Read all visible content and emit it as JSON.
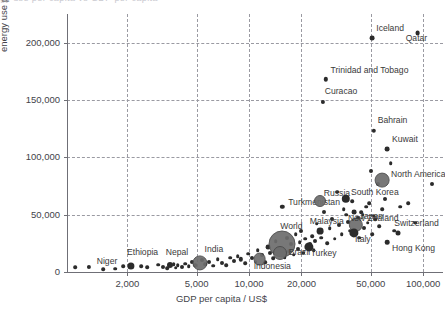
{
  "title_remnant": "gy use per capita vs GDP per capita",
  "chart_data": {
    "type": "scatter",
    "title": "",
    "xlabel": "GDP per capita / US$",
    "ylabel": "energy use per capita / kWh",
    "xscale": "log",
    "yscale": "linear",
    "xlim": [
      900,
      130000
    ],
    "ylim": [
      0,
      225000
    ],
    "grid": true,
    "legend": "none",
    "xticks": [
      "2,000",
      "5,000",
      "10,000",
      "20,000",
      "50,000",
      "100,000"
    ],
    "xtick_values": [
      2000,
      5000,
      10000,
      20000,
      50000,
      100000
    ],
    "yticks": [
      "0",
      "50,000",
      "100,000",
      "150,000",
      "200,000"
    ],
    "ytick_values": [
      0,
      50000,
      100000,
      150000,
      200000
    ],
    "size_encoding": "population",
    "labeled_points": [
      {
        "name": "Niger",
        "x": 1200,
        "y": 4500,
        "r": 2.1,
        "lx": 8,
        "ly": -4
      },
      {
        "name": "Ethiopia",
        "x": 2100,
        "y": 5200,
        "r": 3.6,
        "lx": -4,
        "ly": -12
      },
      {
        "name": "Nepal",
        "x": 3500,
        "y": 6500,
        "r": 3.0,
        "lx": -4,
        "ly": -11
      },
      {
        "name": "India",
        "x": 5200,
        "y": 8200,
        "r": 6.6,
        "lx": 5,
        "ly": -12
      },
      {
        "name": "Indonesia",
        "x": 11500,
        "y": 11500,
        "r": 5.4,
        "lx": -6,
        "ly": 9
      },
      {
        "name": "World",
        "x": 15500,
        "y": 24500,
        "r": 12.5,
        "lx": -2,
        "ly": -16
      },
      {
        "name": "Brazil",
        "x": 15000,
        "y": 17000,
        "r": 6.0,
        "lx": 9,
        "ly": 1
      },
      {
        "name": "Turkey",
        "x": 22000,
        "y": 22000,
        "r": 4.6,
        "lx": 2,
        "ly": 8
      },
      {
        "name": "Turkmenistan",
        "x": 15500,
        "y": 57000,
        "r": 2.2,
        "lx": 6,
        "ly": -3
      },
      {
        "name": "Malaysia",
        "x": 25500,
        "y": 36000,
        "r": 3.4,
        "lx": -10,
        "ly": -8
      },
      {
        "name": "Russia",
        "x": 25500,
        "y": 62000,
        "r": 5.0,
        "lx": 4,
        "ly": -6
      },
      {
        "name": "South Korea",
        "x": 36000,
        "y": 64000,
        "r": 4.2,
        "lx": 5,
        "ly": -5
      },
      {
        "name": "Japan",
        "x": 41000,
        "y": 41000,
        "r": 6.2,
        "lx": 4,
        "ly": -7
      },
      {
        "name": "Italy",
        "x": 40000,
        "y": 34000,
        "r": 4.6,
        "lx": 1,
        "ly": 8
      },
      {
        "name": "New Zealand",
        "x": 40000,
        "y": 52000,
        "r": 2.4,
        "lx": -6,
        "ly": 8
      },
      {
        "name": "North America",
        "x": 58000,
        "y": 80000,
        "r": 6.4,
        "lx": 9,
        "ly": -4
      },
      {
        "name": "Hong Kong",
        "x": 62000,
        "y": 26000,
        "r": 2.3,
        "lx": 5,
        "ly": 8
      },
      {
        "name": "Switzerland",
        "x": 72000,
        "y": 34000,
        "r": 2.5,
        "lx": -4,
        "ly": -8
      },
      {
        "name": "Kuwait",
        "x": 62000,
        "y": 107000,
        "r": 2.4,
        "lx": 5,
        "ly": -8
      },
      {
        "name": "Bahrain",
        "x": 52000,
        "y": 123000,
        "r": 2.2,
        "lx": 4,
        "ly": -9
      },
      {
        "name": "Curacao",
        "x": 26500,
        "y": 148000,
        "r": 2.1,
        "lx": 2,
        "ly": -9
      },
      {
        "name": "Trinidad and Tobago",
        "x": 27500,
        "y": 168000,
        "r": 2.2,
        "lx": 5,
        "ly": -7
      },
      {
        "name": "Iceland",
        "x": 51000,
        "y": 204000,
        "r": 2.4,
        "lx": 4,
        "ly": -8
      },
      {
        "name": "Qatar",
        "x": 93000,
        "y": 208000,
        "r": 2.4,
        "lx": -12,
        "ly": 7
      }
    ],
    "unlabeled_points": [
      {
        "x": 1000,
        "y": 4200,
        "r": 1.8
      },
      {
        "x": 1450,
        "y": 2400,
        "r": 1.8
      },
      {
        "x": 1700,
        "y": 3000,
        "r": 1.8
      },
      {
        "x": 1900,
        "y": 4800,
        "r": 1.8
      },
      {
        "x": 2400,
        "y": 5000,
        "r": 1.8
      },
      {
        "x": 2600,
        "y": 4000,
        "r": 1.8
      },
      {
        "x": 3000,
        "y": 6200,
        "r": 1.8
      },
      {
        "x": 3200,
        "y": 4500,
        "r": 2.0
      },
      {
        "x": 3400,
        "y": 3200,
        "r": 1.8
      },
      {
        "x": 3700,
        "y": 7000,
        "r": 1.8
      },
      {
        "x": 3800,
        "y": 3600,
        "r": 1.8
      },
      {
        "x": 3900,
        "y": 5800,
        "r": 1.8
      },
      {
        "x": 4100,
        "y": 4200,
        "r": 2.0
      },
      {
        "x": 4300,
        "y": 7200,
        "r": 1.8
      },
      {
        "x": 4500,
        "y": 5200,
        "r": 1.8
      },
      {
        "x": 4700,
        "y": 9000,
        "r": 2.0
      },
      {
        "x": 4900,
        "y": 6000,
        "r": 1.8
      },
      {
        "x": 5400,
        "y": 10500,
        "r": 2.0
      },
      {
        "x": 5600,
        "y": 7000,
        "r": 1.8
      },
      {
        "x": 5900,
        "y": 8800,
        "r": 2.0
      },
      {
        "x": 6200,
        "y": 5600,
        "r": 1.8
      },
      {
        "x": 6600,
        "y": 11000,
        "r": 1.8
      },
      {
        "x": 7000,
        "y": 7500,
        "r": 2.0
      },
      {
        "x": 7400,
        "y": 6000,
        "r": 1.8
      },
      {
        "x": 7800,
        "y": 12500,
        "r": 1.8
      },
      {
        "x": 8200,
        "y": 9500,
        "r": 2.0
      },
      {
        "x": 8600,
        "y": 14000,
        "r": 1.8
      },
      {
        "x": 9000,
        "y": 11000,
        "r": 2.2
      },
      {
        "x": 9500,
        "y": 7800,
        "r": 1.8
      },
      {
        "x": 9900,
        "y": 16000,
        "r": 1.8
      },
      {
        "x": 10400,
        "y": 12000,
        "r": 2.0
      },
      {
        "x": 10900,
        "y": 9000,
        "r": 1.8
      },
      {
        "x": 11200,
        "y": 19000,
        "r": 1.8
      },
      {
        "x": 11800,
        "y": 14500,
        "r": 2.0
      },
      {
        "x": 12400,
        "y": 8500,
        "r": 1.8
      },
      {
        "x": 12800,
        "y": 22000,
        "r": 2.4
      },
      {
        "x": 13200,
        "y": 16500,
        "r": 2.0
      },
      {
        "x": 13800,
        "y": 12000,
        "r": 1.8
      },
      {
        "x": 14200,
        "y": 27000,
        "r": 1.8
      },
      {
        "x": 14800,
        "y": 20000,
        "r": 2.0
      },
      {
        "x": 16000,
        "y": 13000,
        "r": 1.8
      },
      {
        "x": 16500,
        "y": 30000,
        "r": 2.0
      },
      {
        "x": 17000,
        "y": 18000,
        "r": 1.8
      },
      {
        "x": 17500,
        "y": 24000,
        "r": 2.0
      },
      {
        "x": 18000,
        "y": 15000,
        "r": 1.8
      },
      {
        "x": 18500,
        "y": 33000,
        "r": 1.8
      },
      {
        "x": 19000,
        "y": 20000,
        "r": 2.0
      },
      {
        "x": 19500,
        "y": 26000,
        "r": 1.8
      },
      {
        "x": 20000,
        "y": 36000,
        "r": 2.0
      },
      {
        "x": 20500,
        "y": 17000,
        "r": 1.8
      },
      {
        "x": 21000,
        "y": 29000,
        "r": 1.8
      },
      {
        "x": 22500,
        "y": 24000,
        "r": 2.0
      },
      {
        "x": 23000,
        "y": 31000,
        "r": 1.8
      },
      {
        "x": 23500,
        "y": 19000,
        "r": 1.8
      },
      {
        "x": 24000,
        "y": 27000,
        "r": 2.0
      },
      {
        "x": 24500,
        "y": 42000,
        "r": 1.8
      },
      {
        "x": 26000,
        "y": 30000,
        "r": 1.8
      },
      {
        "x": 27000,
        "y": 52000,
        "r": 2.0
      },
      {
        "x": 28000,
        "y": 25000,
        "r": 1.8
      },
      {
        "x": 29000,
        "y": 38000,
        "r": 1.8
      },
      {
        "x": 30000,
        "y": 46000,
        "r": 2.0
      },
      {
        "x": 31000,
        "y": 29000,
        "r": 1.8
      },
      {
        "x": 32000,
        "y": 70000,
        "r": 1.8
      },
      {
        "x": 33000,
        "y": 41000,
        "r": 2.0
      },
      {
        "x": 34000,
        "y": 33000,
        "r": 1.8
      },
      {
        "x": 35000,
        "y": 55000,
        "r": 1.8
      },
      {
        "x": 37000,
        "y": 44000,
        "r": 2.0
      },
      {
        "x": 38000,
        "y": 36000,
        "r": 1.8
      },
      {
        "x": 39000,
        "y": 62000,
        "r": 1.8
      },
      {
        "x": 42000,
        "y": 47000,
        "r": 2.0
      },
      {
        "x": 43000,
        "y": 30000,
        "r": 1.8
      },
      {
        "x": 45000,
        "y": 50000,
        "r": 1.8
      },
      {
        "x": 46000,
        "y": 38000,
        "r": 2.0
      },
      {
        "x": 47000,
        "y": 57000,
        "r": 1.8
      },
      {
        "x": 48000,
        "y": 43000,
        "r": 1.8
      },
      {
        "x": 50000,
        "y": 88000,
        "r": 2.0
      },
      {
        "x": 51000,
        "y": 33000,
        "r": 1.8
      },
      {
        "x": 53000,
        "y": 46000,
        "r": 1.8
      },
      {
        "x": 55000,
        "y": 77000,
        "r": 2.0
      },
      {
        "x": 56000,
        "y": 40000,
        "r": 1.8
      },
      {
        "x": 58000,
        "y": 55000,
        "r": 1.8
      },
      {
        "x": 60000,
        "y": 64000,
        "r": 2.0
      },
      {
        "x": 65000,
        "y": 95000,
        "r": 1.8
      },
      {
        "x": 68000,
        "y": 36000,
        "r": 1.8
      },
      {
        "x": 74000,
        "y": 57000,
        "r": 1.8
      },
      {
        "x": 82000,
        "y": 60000,
        "r": 1.8
      },
      {
        "x": 90000,
        "y": 43000,
        "r": 1.8
      },
      {
        "x": 112000,
        "y": 77000,
        "r": 2.0
      },
      {
        "x": 36000,
        "y": 50000,
        "r": 1.8
      },
      {
        "x": 44000,
        "y": 52000,
        "r": 1.8
      },
      {
        "x": 49000,
        "y": 60000,
        "r": 1.8
      },
      {
        "x": 52000,
        "y": 49000,
        "r": 1.8
      }
    ]
  }
}
